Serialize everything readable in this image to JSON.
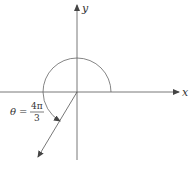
{
  "diagram": {
    "title": "",
    "axes": {
      "x_label": "x",
      "y_label": "y"
    },
    "angle": {
      "symbol": "θ",
      "equals": "=",
      "numerator": "4π",
      "denominator": "3"
    },
    "colors": {
      "stroke": "#444444",
      "text": "#333333"
    }
  }
}
